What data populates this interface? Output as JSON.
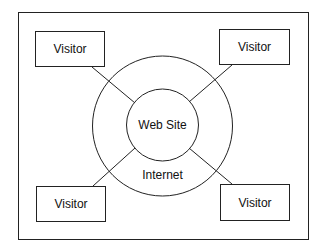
{
  "diagram": {
    "center_label": "Web Site",
    "ring_label": "Internet",
    "visitors": [
      {
        "label": "Visitor",
        "position": "top-left"
      },
      {
        "label": "Visitor",
        "position": "top-right"
      },
      {
        "label": "Visitor",
        "position": "bottom-left"
      },
      {
        "label": "Visitor",
        "position": "bottom-right"
      }
    ],
    "colors": {
      "stroke": "#222222",
      "background": "#ffffff",
      "text": "#111111"
    }
  }
}
